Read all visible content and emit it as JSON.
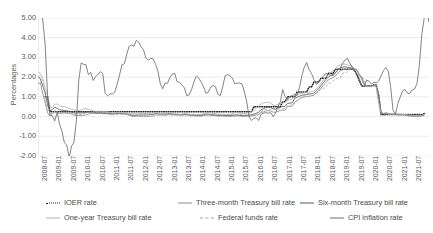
{
  "chart_data": {
    "type": "line",
    "title": "",
    "xlabel": "",
    "ylabel": "Percentages",
    "ylim": [
      -2.0,
      5.0
    ],
    "ytick_values": [
      5.0,
      4.0,
      3.0,
      2.0,
      1.0,
      0.0,
      -1.0,
      -2.0
    ],
    "ytick_labels": [
      "5.00",
      "4.00",
      "3.00",
      "2.00",
      "1.00",
      "0.00",
      "-1.00",
      "-2.00"
    ],
    "grid": "horizontal",
    "legend_position": "bottom",
    "x_start": "2008-07",
    "x_end": "2021-07",
    "x_step_months": 1,
    "xtick_labels": [
      "2008-07",
      "2009-01",
      "2009-07",
      "2010-01",
      "2010-07",
      "2011-01",
      "2011-07",
      "2012-01",
      "2012-07",
      "2013-01",
      "2013-07",
      "2014-01",
      "2014-07",
      "2015-01",
      "2015-07",
      "2016-01",
      "2016-07",
      "2017-01",
      "2017-07",
      "2018-01",
      "2018-07",
      "2019-01",
      "2019-07",
      "2020-01",
      "2020-07",
      "2021-01",
      "2021-07"
    ],
    "series": [
      {
        "name": "IOER rate",
        "style": "dotted",
        "color": "#1a1a1a",
        "values": [
          null,
          null,
          null,
          1.0,
          1.0,
          0.25,
          0.25,
          0.25,
          0.25,
          0.25,
          0.25,
          0.25,
          0.25,
          0.25,
          0.25,
          0.25,
          0.25,
          0.25,
          0.25,
          0.25,
          0.25,
          0.25,
          0.25,
          0.25,
          0.25,
          0.25,
          0.25,
          0.25,
          0.25,
          0.25,
          0.25,
          0.25,
          0.25,
          0.25,
          0.25,
          0.25,
          0.25,
          0.25,
          0.25,
          0.25,
          0.25,
          0.25,
          0.25,
          0.25,
          0.25,
          0.25,
          0.25,
          0.25,
          0.25,
          0.25,
          0.25,
          0.25,
          0.25,
          0.25,
          0.25,
          0.25,
          0.25,
          0.25,
          0.25,
          0.25,
          0.25,
          0.25,
          0.25,
          0.25,
          0.25,
          0.25,
          0.25,
          0.25,
          0.25,
          0.25,
          0.25,
          0.25,
          0.25,
          0.25,
          0.25,
          0.25,
          0.25,
          0.25,
          0.25,
          0.25,
          0.25,
          0.25,
          0.25,
          0.25,
          0.25,
          0.25,
          0.25,
          0.25,
          0.25,
          0.25,
          0.5,
          0.5,
          0.5,
          0.5,
          0.5,
          0.5,
          0.5,
          0.5,
          0.5,
          0.5,
          0.5,
          0.5,
          0.75,
          0.75,
          1.0,
          1.0,
          1.0,
          1.0,
          1.25,
          1.25,
          1.25,
          1.25,
          1.25,
          1.5,
          1.5,
          1.75,
          1.75,
          1.75,
          1.95,
          1.95,
          1.95,
          2.2,
          2.2,
          2.2,
          2.4,
          2.4,
          2.4,
          2.4,
          2.4,
          2.4,
          2.4,
          2.4,
          2.35,
          2.1,
          1.8,
          1.55,
          1.55,
          1.55,
          1.55,
          1.55,
          1.6,
          1.6,
          1.1,
          0.1,
          0.1,
          0.1,
          0.1,
          0.1,
          0.1,
          0.1,
          0.1,
          0.1,
          0.1,
          0.1,
          0.1,
          0.1,
          0.1,
          0.1,
          0.1,
          0.1,
          0.1,
          0.15
        ]
      },
      {
        "name": "Three-month Treasury bill rate",
        "style": "solid",
        "color": "#8c8c8c",
        "values": [
          1.66,
          1.72,
          1.15,
          0.69,
          0.19,
          0.03,
          0.13,
          0.3,
          0.22,
          0.16,
          0.18,
          0.18,
          0.18,
          0.17,
          0.12,
          0.07,
          0.05,
          0.06,
          0.05,
          0.06,
          0.09,
          0.13,
          0.15,
          0.16,
          0.15,
          0.15,
          0.16,
          0.15,
          0.14,
          0.14,
          0.12,
          0.12,
          0.13,
          0.13,
          0.14,
          0.12,
          0.13,
          0.11,
          0.07,
          0.02,
          0.01,
          0.03,
          0.02,
          0.01,
          0.02,
          0.01,
          0.01,
          0.01,
          0.03,
          0.09,
          0.08,
          0.07,
          0.08,
          0.07,
          0.1,
          0.1,
          0.09,
          0.09,
          0.08,
          0.07,
          0.07,
          0.1,
          0.09,
          0.06,
          0.04,
          0.05,
          0.03,
          0.03,
          0.02,
          0.05,
          0.07,
          0.07,
          0.06,
          0.05,
          0.05,
          0.03,
          0.03,
          0.03,
          0.02,
          0.02,
          0.02,
          0.02,
          0.03,
          0.04,
          0.03,
          0.02,
          0.02,
          0.02,
          0.02,
          0.03,
          0.05,
          0.08,
          0.1,
          0.21,
          0.23,
          0.29,
          0.3,
          0.28,
          0.23,
          0.21,
          0.27,
          0.3,
          0.33,
          0.32,
          0.51,
          0.52,
          0.53,
          0.75,
          0.8,
          0.9,
          0.98,
          1.0,
          1.02,
          1.03,
          1.06,
          1.07,
          1.2,
          1.3,
          1.44,
          1.59,
          1.73,
          1.86,
          1.93,
          1.98,
          2.06,
          2.2,
          2.33,
          2.37,
          2.4,
          2.41,
          2.43,
          2.41,
          2.39,
          2.35,
          2.13,
          1.98,
          1.65,
          1.57,
          1.58,
          1.54,
          1.57,
          1.55,
          1.15,
          0.28,
          0.13,
          0.16,
          0.13,
          0.1,
          0.11,
          0.1,
          0.09,
          0.08,
          0.09,
          0.08,
          0.04,
          0.03,
          0.02,
          0.02,
          0.02,
          0.02,
          0.04,
          0.05
        ]
      },
      {
        "name": "Six-month Treasury bill rate",
        "style": "solid",
        "color": "#5b5b5b",
        "values": [
          2.03,
          1.9,
          1.55,
          1.2,
          0.58,
          0.3,
          0.35,
          0.47,
          0.42,
          0.34,
          0.33,
          0.31,
          0.29,
          0.27,
          0.23,
          0.18,
          0.17,
          0.19,
          0.18,
          0.19,
          0.21,
          0.23,
          0.23,
          0.22,
          0.2,
          0.19,
          0.19,
          0.18,
          0.17,
          0.17,
          0.15,
          0.14,
          0.15,
          0.15,
          0.16,
          0.15,
          0.15,
          0.14,
          0.11,
          0.07,
          0.06,
          0.08,
          0.08,
          0.07,
          0.09,
          0.08,
          0.09,
          0.1,
          0.12,
          0.15,
          0.14,
          0.13,
          0.13,
          0.12,
          0.15,
          0.15,
          0.13,
          0.12,
          0.11,
          0.1,
          0.09,
          0.13,
          0.12,
          0.09,
          0.07,
          0.08,
          0.06,
          0.06,
          0.06,
          0.1,
          0.13,
          0.13,
          0.11,
          0.09,
          0.08,
          0.06,
          0.06,
          0.06,
          0.05,
          0.05,
          0.05,
          0.06,
          0.08,
          0.09,
          0.06,
          0.05,
          0.05,
          0.06,
          0.07,
          0.09,
          0.12,
          0.17,
          0.22,
          0.35,
          0.4,
          0.46,
          0.48,
          0.46,
          0.4,
          0.37,
          0.44,
          0.48,
          0.51,
          0.52,
          0.67,
          0.68,
          0.7,
          0.92,
          0.98,
          1.03,
          1.08,
          1.1,
          1.12,
          1.14,
          1.16,
          1.18,
          1.3,
          1.42,
          1.57,
          1.73,
          1.88,
          1.99,
          2.08,
          2.15,
          2.23,
          2.37,
          2.47,
          2.51,
          2.52,
          2.5,
          2.48,
          2.45,
          2.42,
          2.36,
          2.1,
          1.93,
          1.62,
          1.57,
          1.58,
          1.55,
          1.57,
          1.53,
          0.99,
          0.2,
          0.15,
          0.18,
          0.16,
          0.13,
          0.13,
          0.12,
          0.11,
          0.1,
          0.1,
          0.09,
          0.06,
          0.05,
          0.04,
          0.04,
          0.04,
          0.04,
          0.05,
          0.06
        ]
      },
      {
        "name": "One-year Treasury bill rate",
        "style": "solid",
        "color": "#b3b3b3",
        "values": [
          2.28,
          2.18,
          1.91,
          1.42,
          1.07,
          0.49,
          0.44,
          0.62,
          0.64,
          0.55,
          0.5,
          0.51,
          0.46,
          0.4,
          0.38,
          0.35,
          0.3,
          0.31,
          0.33,
          0.39,
          0.41,
          0.38,
          0.32,
          0.29,
          0.26,
          0.27,
          0.27,
          0.26,
          0.24,
          0.24,
          0.21,
          0.19,
          0.2,
          0.21,
          0.22,
          0.2,
          0.19,
          0.18,
          0.17,
          0.15,
          0.16,
          0.18,
          0.17,
          0.15,
          0.17,
          0.16,
          0.17,
          0.18,
          0.17,
          0.2,
          0.17,
          0.16,
          0.16,
          0.15,
          0.18,
          0.19,
          0.16,
          0.14,
          0.13,
          0.12,
          0.12,
          0.16,
          0.15,
          0.12,
          0.11,
          0.12,
          0.1,
          0.11,
          0.11,
          0.16,
          0.21,
          0.21,
          0.19,
          0.16,
          0.15,
          0.12,
          0.12,
          0.13,
          0.11,
          0.12,
          0.12,
          0.14,
          0.19,
          0.21,
          0.16,
          0.14,
          0.15,
          0.17,
          0.2,
          0.24,
          0.3,
          0.42,
          0.49,
          0.65,
          0.7,
          0.71,
          0.73,
          0.68,
          0.59,
          0.55,
          0.63,
          0.66,
          0.68,
          0.72,
          0.83,
          0.85,
          0.88,
          1.08,
          1.13,
          1.15,
          1.18,
          1.2,
          1.22,
          1.24,
          1.26,
          1.3,
          1.4,
          1.53,
          1.7,
          1.86,
          2.01,
          2.12,
          2.23,
          2.33,
          2.42,
          2.55,
          2.65,
          2.67,
          2.66,
          2.62,
          2.58,
          2.52,
          2.44,
          2.37,
          2.08,
          1.88,
          1.57,
          1.53,
          1.54,
          1.52,
          1.56,
          1.5,
          0.75,
          0.19,
          0.16,
          0.18,
          0.16,
          0.14,
          0.13,
          0.13,
          0.12,
          0.12,
          0.11,
          0.1,
          0.08,
          0.07,
          0.06,
          0.06,
          0.06,
          0.06,
          0.07,
          0.08
        ]
      },
      {
        "name": "Federal funds rate",
        "style": "dashed",
        "color": "#a6a6a6",
        "values": [
          2.01,
          2.0,
          1.81,
          0.97,
          0.39,
          0.16,
          0.15,
          0.22,
          0.18,
          0.15,
          0.18,
          0.21,
          0.16,
          0.15,
          0.16,
          0.12,
          0.12,
          0.12,
          0.11,
          0.13,
          0.2,
          0.19,
          0.19,
          0.2,
          0.18,
          0.19,
          0.19,
          0.2,
          0.19,
          0.18,
          0.19,
          0.19,
          0.16,
          0.14,
          0.16,
          0.16,
          0.17,
          0.14,
          0.1,
          0.09,
          0.1,
          0.1,
          0.16,
          0.14,
          0.14,
          0.16,
          0.14,
          0.16,
          0.14,
          0.16,
          0.15,
          0.14,
          0.11,
          0.09,
          0.08,
          0.09,
          0.09,
          0.08,
          0.09,
          0.09,
          0.08,
          0.07,
          0.07,
          0.09,
          0.09,
          0.09,
          0.08,
          0.09,
          0.09,
          0.08,
          0.07,
          0.09,
          0.07,
          0.08,
          0.09,
          0.1,
          0.09,
          0.08,
          0.09,
          0.09,
          0.1,
          0.09,
          0.09,
          0.12,
          0.12,
          0.12,
          0.14,
          0.12,
          0.13,
          0.12,
          0.12,
          0.14,
          0.12,
          0.24,
          0.34,
          0.38,
          0.36,
          0.37,
          0.37,
          0.38,
          0.39,
          0.4,
          0.4,
          0.4,
          0.54,
          0.55,
          0.66,
          0.65,
          0.79,
          0.91,
          0.96,
          1.04,
          1.15,
          1.16,
          1.15,
          1.16,
          1.16,
          1.3,
          1.41,
          1.42,
          1.51,
          1.7,
          1.7,
          1.82,
          1.91,
          1.95,
          1.95,
          2.2,
          2.2,
          2.27,
          2.4,
          2.41,
          2.39,
          2.38,
          2.13,
          2.04,
          1.83,
          1.55,
          1.55,
          1.55,
          1.58,
          1.58,
          0.65,
          0.05,
          0.05,
          0.08,
          0.09,
          0.1,
          0.09,
          0.09,
          0.09,
          0.09,
          0.09,
          0.09,
          0.08,
          0.07,
          0.07,
          0.06,
          0.06,
          0.06,
          0.08,
          0.1
        ]
      },
      {
        "name": "CPI inflation rate",
        "style": "solid",
        "color": "#6e6e6e",
        "values": [
          5.5,
          5.35,
          4.88,
          3.64,
          1.05,
          0.08,
          0.03,
          -0.22,
          0.22,
          -0.4,
          -0.75,
          -1.33,
          -1.45,
          -2.09,
          -1.5,
          -1.3,
          -0.2,
          1.85,
          2.72,
          2.65,
          2.63,
          2.13,
          2.24,
          1.83,
          2.02,
          2.15,
          2.27,
          2.19,
          1.18,
          1.05,
          1.15,
          1.15,
          1.24,
          1.64,
          2.11,
          2.63,
          2.68,
          3.16,
          3.57,
          3.63,
          3.56,
          3.87,
          3.77,
          3.53,
          3.39,
          2.96,
          2.87,
          2.96,
          2.93,
          2.65,
          2.3,
          1.66,
          1.41,
          1.7,
          1.69,
          1.99,
          2.16,
          2.2,
          1.76,
          1.74,
          1.59,
          1.47,
          1.06,
          1.1,
          1.36,
          1.75,
          2.06,
          1.96,
          1.75,
          1.52,
          1.18,
          1.24,
          1.5,
          1.58,
          1.51,
          1.13,
          1.06,
          1.51,
          2.07,
          2.13,
          2.07,
          1.96,
          1.66,
          1.7,
          1.7,
          1.66,
          1.28,
          0.76,
          0.0,
          -0.2,
          -0.09,
          -0.07,
          -0.2,
          0.12,
          0.17,
          0.2,
          0.17,
          0.2,
          0.0,
          0.17,
          0.5,
          0.73,
          1.37,
          1.02,
          0.85,
          1.02,
          1.06,
          1.13,
          1.06,
          1.46,
          2.07,
          2.5,
          2.74,
          2.38,
          2.2,
          1.87,
          1.63,
          1.73,
          1.94,
          2.04,
          2.2,
          2.13,
          2.11,
          2.07,
          2.21,
          2.36,
          2.46,
          2.7,
          2.87,
          2.95,
          2.7,
          2.52,
          2.28,
          2.18,
          1.91,
          1.55,
          1.52,
          1.86,
          1.79,
          1.65,
          1.75,
          1.71,
          1.81,
          2.05,
          2.33,
          2.49,
          2.31,
          1.52,
          0.33,
          0.12,
          0.65,
          0.99,
          1.31,
          1.37,
          1.18,
          1.17,
          1.36,
          1.4,
          1.68,
          2.62,
          4.16,
          4.99,
          5.39,
          4.78
        ]
      }
    ]
  },
  "legend": {
    "items": [
      {
        "label": "IOER rate",
        "style": "dotted",
        "color": "#1a1a1a",
        "name": "legend-ioer-rate"
      },
      {
        "label": "Three-month Treasury bill rate",
        "style": "solid",
        "color": "#8c8c8c",
        "name": "legend-three-month-treasury-bill-rate"
      },
      {
        "label": "Six-month Treasury bill rate",
        "style": "solid",
        "color": "#5b5b5b",
        "name": "legend-six-month-treasury-bill-rate"
      },
      {
        "label": "One-year Treasury bill rate",
        "style": "solid",
        "color": "#b3b3b3",
        "name": "legend-one-year-treasury-bill-rate"
      },
      {
        "label": "Federal funds rate",
        "style": "dashed",
        "color": "#a6a6a6",
        "name": "legend-federal-funds-rate"
      },
      {
        "label": "CPI inflation rate",
        "style": "solid",
        "color": "#6e6e6e",
        "name": "legend-cpi-inflation-rate"
      }
    ]
  },
  "colors": {
    "gridline": "#e2e2e2",
    "axis": "#d0d0d0",
    "text": "#595959",
    "background": "#ffffff"
  }
}
